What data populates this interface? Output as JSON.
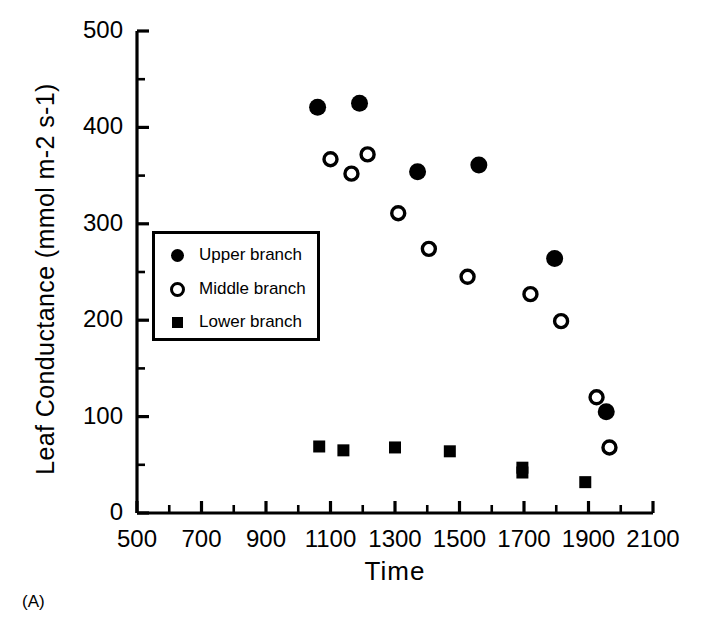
{
  "figure": {
    "panel_tag": "(A)",
    "ylabel": "Leaf Conductance (mmol m-2 s-1)",
    "xlabel": "Time"
  },
  "chart_data": {
    "type": "scatter",
    "title": "",
    "xlabel": "Time",
    "ylabel": "Leaf Conductance (mmol m-2 s-1)",
    "xlim": [
      500,
      2100
    ],
    "ylim": [
      0,
      500
    ],
    "xticks": [
      500,
      700,
      900,
      1100,
      1300,
      1500,
      1700,
      1900,
      2100
    ],
    "yticks": [
      0,
      100,
      200,
      300,
      400,
      500
    ],
    "x_minor_interval": 100,
    "y_minor_interval": 50,
    "grid": false,
    "legend_position": "upper left inside",
    "series": [
      {
        "name": "Upper branch",
        "marker": "filled-circle",
        "color": "#000000",
        "points": [
          {
            "x": 1060,
            "y": 421
          },
          {
            "x": 1190,
            "y": 425
          },
          {
            "x": 1370,
            "y": 354
          },
          {
            "x": 1560,
            "y": 361
          },
          {
            "x": 1795,
            "y": 264
          },
          {
            "x": 1955,
            "y": 105
          }
        ]
      },
      {
        "name": "Middle branch",
        "marker": "open-circle",
        "color": "#000000",
        "points": [
          {
            "x": 1100,
            "y": 367
          },
          {
            "x": 1165,
            "y": 352
          },
          {
            "x": 1215,
            "y": 372
          },
          {
            "x": 1310,
            "y": 311
          },
          {
            "x": 1405,
            "y": 274
          },
          {
            "x": 1525,
            "y": 245
          },
          {
            "x": 1720,
            "y": 227
          },
          {
            "x": 1815,
            "y": 199
          },
          {
            "x": 1925,
            "y": 120
          },
          {
            "x": 1965,
            "y": 68
          }
        ]
      },
      {
        "name": "Lower branch",
        "marker": "filled-square",
        "color": "#000000",
        "points": [
          {
            "x": 1065,
            "y": 69
          },
          {
            "x": 1140,
            "y": 65
          },
          {
            "x": 1300,
            "y": 68
          },
          {
            "x": 1470,
            "y": 64
          },
          {
            "x": 1695,
            "y": 47
          },
          {
            "x": 1695,
            "y": 42
          },
          {
            "x": 1890,
            "y": 32
          }
        ]
      }
    ]
  },
  "legend": {
    "items": [
      {
        "label": "Upper branch",
        "marker": "filled-circle"
      },
      {
        "label": "Middle branch",
        "marker": "open-circle"
      },
      {
        "label": "Lower branch",
        "marker": "filled-square"
      }
    ]
  }
}
